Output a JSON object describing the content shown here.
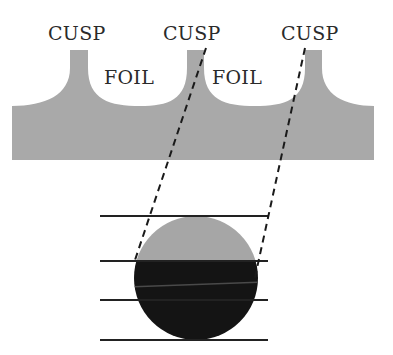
{
  "diagram": {
    "labels": {
      "cusp_left": "CUSP",
      "cusp_middle": "CUSP",
      "cusp_right": "CUSP",
      "foil_left": "FOIL",
      "foil_right": "FOIL"
    },
    "colors": {
      "background": "#ffffff",
      "foil_gray": "#a9a9a9",
      "circle_top": "#a6a6a6",
      "circle_bottom": "#141414",
      "line": "#222222",
      "dashed": "#1a1a1a",
      "text": "#2a2a2a"
    },
    "elements": {
      "foil_structure": "Gray foil cross-section with three upward cusps separated by two rounded foil pockets",
      "projection_lines": 2,
      "horizontal_lines": 4,
      "circle": "Circle split horizontally: light gray top segment, black lower segment"
    }
  }
}
